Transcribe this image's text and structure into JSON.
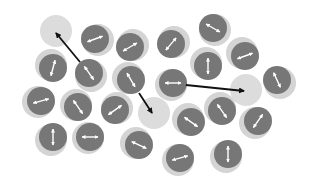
{
  "diagram": {
    "colors": {
      "background": "#ffffff",
      "halo": "#d4d4d4",
      "particle": "#777777",
      "spin_arrow": "#ffffff",
      "vacancy": "#dcdcdc",
      "hop_arrow": "#111111"
    },
    "particle_radius": 14,
    "halo_radius": 16,
    "particles": [
      {
        "x": 95,
        "y": 39,
        "angle": -20,
        "hx": 3,
        "hy": 1
      },
      {
        "x": 130,
        "y": 47,
        "angle": -30,
        "hx": 3,
        "hy": -2
      },
      {
        "x": 171,
        "y": 44,
        "angle": -50,
        "hx": 3,
        "hy": -2
      },
      {
        "x": 213,
        "y": 28,
        "angle": 30,
        "hx": 2,
        "hy": 2
      },
      {
        "x": 53,
        "y": 68,
        "angle": -75,
        "hx": -2,
        "hy": -3
      },
      {
        "x": 89,
        "y": 73,
        "angle": 55,
        "hx": 2,
        "hy": 3
      },
      {
        "x": 131,
        "y": 80,
        "angle": 60,
        "hx": -3,
        "hy": -2
      },
      {
        "x": 173,
        "y": 83,
        "angle": 0,
        "hx": -2,
        "hy": 2
      },
      {
        "x": 208,
        "y": 66,
        "angle": 90,
        "hx": -2,
        "hy": -3
      },
      {
        "x": 245,
        "y": 56,
        "angle": -20,
        "hx": -3,
        "hy": -3
      },
      {
        "x": 277,
        "y": 80,
        "angle": 65,
        "hx": 3,
        "hy": 3
      },
      {
        "x": 41,
        "y": 101,
        "angle": -15,
        "hx": -3,
        "hy": 1
      },
      {
        "x": 78,
        "y": 107,
        "angle": 55,
        "hx": -2,
        "hy": -2
      },
      {
        "x": 115,
        "y": 110,
        "angle": -35,
        "hx": 2,
        "hy": -2
      },
      {
        "x": 53,
        "y": 137,
        "angle": 90,
        "hx": -2,
        "hy": 3
      },
      {
        "x": 90,
        "y": 137,
        "angle": 0,
        "hx": -2,
        "hy": 1
      },
      {
        "x": 139,
        "y": 145,
        "angle": 25,
        "hx": -3,
        "hy": -2
      },
      {
        "x": 191,
        "y": 122,
        "angle": 35,
        "hx": -3,
        "hy": -3
      },
      {
        "x": 222,
        "y": 111,
        "angle": 55,
        "hx": -2,
        "hy": -3
      },
      {
        "x": 258,
        "y": 121,
        "angle": -55,
        "hx": -3,
        "hy": 2
      },
      {
        "x": 180,
        "y": 158,
        "angle": -15,
        "hx": -2,
        "hy": 2
      },
      {
        "x": 228,
        "y": 154,
        "angle": 90,
        "hx": -2,
        "hy": 3
      }
    ],
    "vacancies": [
      {
        "x": 56,
        "y": 31
      },
      {
        "x": 246,
        "y": 90
      },
      {
        "x": 154,
        "y": 113
      }
    ],
    "hops": [
      {
        "x1": 80,
        "y1": 62,
        "x2": 56,
        "y2": 33
      },
      {
        "x1": 139,
        "y1": 93,
        "x2": 152,
        "y2": 113
      },
      {
        "x1": 186,
        "y1": 85,
        "x2": 244,
        "y2": 91
      }
    ]
  }
}
